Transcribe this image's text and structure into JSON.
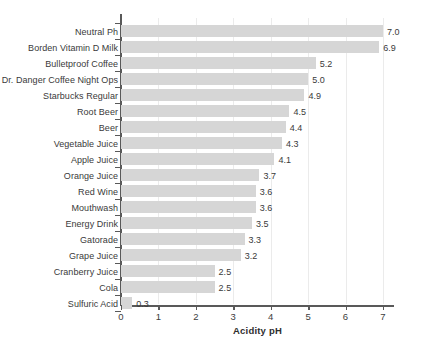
{
  "chart_data": {
    "type": "bar",
    "orientation": "horizontal",
    "title": "",
    "xlabel": "Acidity pH",
    "ylabel": "",
    "xlim": [
      0,
      7.3
    ],
    "xticks": [
      0,
      1,
      2,
      3,
      4,
      5,
      6,
      7
    ],
    "xticklabels": [
      "0",
      "1",
      "2",
      "3",
      "4",
      "5",
      "6",
      "7"
    ],
    "grid": "vertical",
    "legend": "none",
    "bar_color": "#d6d6d6",
    "axis_color": "#595959",
    "text_color": "#3a3a3a",
    "categories": [
      "Neutral Ph",
      "Borden Vitamin D Milk",
      "Bulletproof Coffee",
      "Dr. Danger Coffee Night Ops",
      "Starbucks Regular",
      "Root Beer",
      "Beer",
      "Vegetable Juice",
      "Apple Juice",
      "Orange Juice",
      "Red Wine",
      "Mouthwash",
      "Energy Drink",
      "Gatorade",
      "Grape Juice",
      "Cranberry Juice",
      "Cola",
      "Sulfuric Acid"
    ],
    "values": [
      7.0,
      6.9,
      5.2,
      5.0,
      4.9,
      4.5,
      4.4,
      4.3,
      4.1,
      3.7,
      3.6,
      3.6,
      3.5,
      3.3,
      3.2,
      2.5,
      2.5,
      0.3
    ],
    "value_labels": [
      "7.0",
      "6.9",
      "5.2",
      "5.0",
      "4.9",
      "4.5",
      "4.4",
      "4.3",
      "4.1",
      "3.7",
      "3.6",
      "3.6",
      "3.5",
      "3.3",
      "3.2",
      "2.5",
      "2.5",
      "0.3"
    ]
  }
}
